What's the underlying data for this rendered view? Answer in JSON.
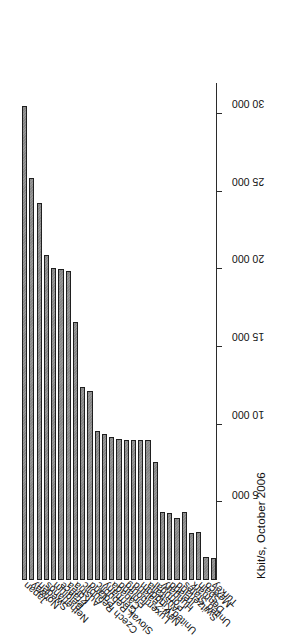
{
  "figure": {
    "axis_title": "Kbit/s, October 2006",
    "orientation": "rotated-90",
    "bar_fill_color": "#858585",
    "bar_border_color": "#1f1f1f",
    "axis_color": "#2b2b2b",
    "background_color": "#ffffff"
  },
  "chart_data": {
    "type": "bar",
    "title": "",
    "subtitle": "",
    "xlabel": "",
    "ylabel": "Kbit/s, October 2006",
    "orientation": "horizontal",
    "grid": false,
    "legend": false,
    "legend_position": "none",
    "axis_range": [
      0,
      32000
    ],
    "tick_values": [
      5000,
      10000,
      15000,
      20000,
      25000,
      30000
    ],
    "tick_labels": [
      "5 000",
      "10 000",
      "15 000",
      "20 000",
      "25 000",
      "30 000"
    ],
    "categories": [
      "Japan",
      "Norway",
      "Sweden",
      "Netherlands",
      "Belgium",
      "France",
      "Korea",
      "Austria",
      "Czech Republic",
      "Poland",
      "Slovak Republic",
      "Germany",
      "Canada",
      "Finland",
      "Luxembourg",
      "New Zealand",
      "United Kingdom",
      "Australia",
      "Portugal",
      "Hungary",
      "Ireland",
      "Switzerland",
      "United States",
      "Denmark",
      "Spain",
      "Mexico",
      "Turkey"
    ],
    "values": [
      30500,
      25900,
      24300,
      20900,
      20100,
      20000,
      19900,
      16600,
      12400,
      12200,
      9600,
      9400,
      9200,
      9100,
      9000,
      9000,
      9000,
      9000,
      7600,
      4400,
      4300,
      4000,
      4400,
      3000,
      3100,
      1500,
      1400
    ],
    "units": "Kbit/s"
  }
}
